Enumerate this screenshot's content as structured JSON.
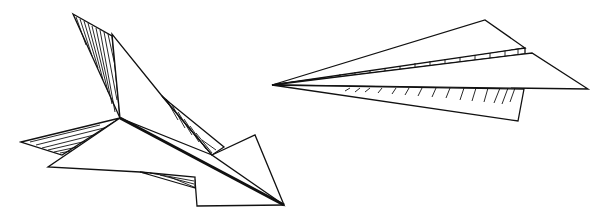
{
  "scene": {
    "description": "Line drawing of two paper airplanes",
    "background": "#ffffff",
    "stroke_color": "#111111",
    "objects": [
      {
        "name": "paper-airplane-left",
        "style": "hatched line art, angled downward to the right"
      },
      {
        "name": "paper-airplane-right",
        "style": "hatched line art, pointing left"
      }
    ]
  }
}
